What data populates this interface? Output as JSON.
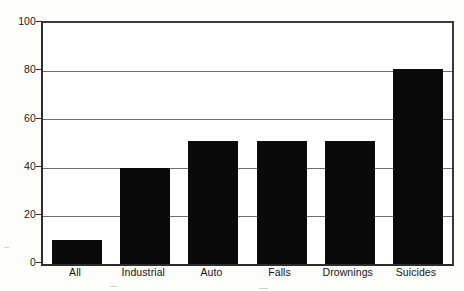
{
  "chart_data": {
    "type": "bar",
    "title": "",
    "subtitle": "",
    "xlabel": "",
    "ylabel": "",
    "categories": [
      "All",
      "Industrial",
      "Auto",
      "Falls",
      "Drownings",
      "Suicides"
    ],
    "values": [
      10,
      40,
      51,
      51,
      51,
      81
    ],
    "ylim": [
      0,
      100
    ],
    "yticks": [
      0,
      20,
      40,
      60,
      80,
      100
    ],
    "ytick_labels": [
      "0",
      "20",
      "40",
      "60",
      "80",
      "100"
    ],
    "grid": true,
    "grid_axis": "y",
    "legend": false,
    "legend_position": "none",
    "bar_color": "#0a0a0a",
    "plot_background": "#ffffff",
    "axis_color": "#2c2c2c",
    "gridline_color": "#6d6d6d"
  },
  "axis": {
    "y_labels": [
      {
        "value": "100"
      },
      {
        "value": "80"
      },
      {
        "value": "60"
      },
      {
        "value": "40"
      },
      {
        "value": "20"
      },
      {
        "value": "0"
      }
    ]
  }
}
